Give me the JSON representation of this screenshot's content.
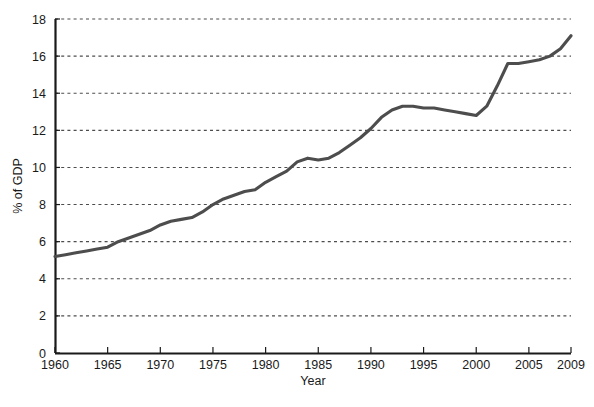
{
  "chart_data": {
    "type": "line",
    "title": "",
    "xlabel": "Year",
    "ylabel": "% of GDP",
    "xlim": [
      1960,
      2009
    ],
    "ylim": [
      0,
      18
    ],
    "grid": true,
    "grid_axis": "y",
    "legend": false,
    "line_color": "#4d4d4d",
    "axis_color": "#1a1a1a",
    "grid_color": "#4d4d4d",
    "background": "#ffffff",
    "xticks": [
      1960,
      1965,
      1970,
      1975,
      1980,
      1985,
      1990,
      1995,
      2000,
      2005,
      2009
    ],
    "xtick_labels": [
      "1960",
      "1965",
      "1970",
      "1975",
      "1980",
      "1985",
      "1990",
      "1995",
      "2000",
      "2005",
      "2009"
    ],
    "yticks": [
      0,
      2,
      4,
      6,
      8,
      10,
      12,
      14,
      16,
      18
    ],
    "ytick_labels": [
      "0",
      "2",
      "4",
      "6",
      "8",
      "10",
      "12",
      "14",
      "16",
      "18"
    ],
    "x": [
      1960,
      1961,
      1962,
      1963,
      1964,
      1965,
      1966,
      1967,
      1968,
      1969,
      1970,
      1971,
      1972,
      1973,
      1974,
      1975,
      1976,
      1977,
      1978,
      1979,
      1980,
      1981,
      1982,
      1983,
      1984,
      1985,
      1986,
      1987,
      1988,
      1989,
      1990,
      1991,
      1992,
      1993,
      1994,
      1995,
      1996,
      1997,
      1998,
      1999,
      2000,
      2001,
      2002,
      2003,
      2004,
      2005,
      2006,
      2007,
      2008,
      2009
    ],
    "values": [
      5.2,
      5.3,
      5.4,
      5.5,
      5.6,
      5.7,
      6.0,
      6.2,
      6.4,
      6.6,
      6.9,
      7.1,
      7.2,
      7.3,
      7.6,
      8.0,
      8.3,
      8.5,
      8.7,
      8.8,
      9.2,
      9.5,
      9.8,
      10.3,
      10.5,
      10.4,
      10.5,
      10.8,
      11.2,
      11.6,
      12.1,
      12.7,
      13.1,
      13.3,
      13.3,
      13.2,
      13.2,
      13.1,
      13.0,
      12.9,
      12.8,
      13.3,
      14.4,
      15.6,
      15.6,
      15.7,
      15.8,
      16.0,
      16.4,
      17.1
    ]
  },
  "axes": {
    "y_title": "% of GDP",
    "x_title": "Year"
  }
}
